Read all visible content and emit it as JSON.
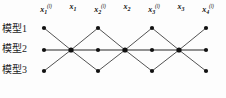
{
  "figure": {
    "background_color": "#fdfdfd",
    "node_color": "#111111",
    "edge_color": "#4a4a4a",
    "middle_edge_color": "#6b6b6b"
  },
  "row_labels": [
    {
      "text": "模型1"
    },
    {
      "text": "模型2"
    },
    {
      "text": "模型3"
    }
  ],
  "column_labels": [
    {
      "base": "x",
      "sub": "1",
      "sup": "(l)",
      "hat": "",
      "x": 46
    },
    {
      "base": "x",
      "sub": "1",
      "sup": "",
      "hat": "ˆ",
      "x": 73
    },
    {
      "base": "x",
      "sub": "2",
      "sup": "(l)",
      "hat": "",
      "x": 100
    },
    {
      "base": "x",
      "sub": "2",
      "sup": "",
      "hat": "ˆ",
      "x": 127
    },
    {
      "base": "x",
      "sub": "3",
      "sup": "(l)",
      "hat": "",
      "x": 154
    },
    {
      "base": "x",
      "sub": "3",
      "sup": "",
      "hat": "ˆ",
      "x": 181
    },
    {
      "base": "x",
      "sub": "4",
      "sup": "(l)",
      "hat": "",
      "x": 208
    }
  ],
  "graph": {
    "columns_x": [
      44,
      71,
      98,
      125,
      152,
      179,
      206
    ],
    "rows_y": {
      "top": 28,
      "middle": 50,
      "bottom": 71
    },
    "nodes": [
      {
        "name": "top-1",
        "col": 0,
        "row": "top"
      },
      {
        "name": "top-2",
        "col": 2,
        "row": "top"
      },
      {
        "name": "top-3",
        "col": 4,
        "row": "top"
      },
      {
        "name": "top-4",
        "col": 6,
        "row": "top"
      },
      {
        "name": "mid-1",
        "col": 0,
        "row": "middle"
      },
      {
        "name": "mid-2",
        "col": 1,
        "row": "middle"
      },
      {
        "name": "mid-3",
        "col": 2,
        "row": "middle"
      },
      {
        "name": "mid-4",
        "col": 3,
        "row": "middle"
      },
      {
        "name": "mid-5",
        "col": 4,
        "row": "middle"
      },
      {
        "name": "mid-6",
        "col": 5,
        "row": "middle"
      },
      {
        "name": "mid-7",
        "col": 6,
        "row": "middle"
      },
      {
        "name": "bottom-1",
        "col": 0,
        "row": "bottom"
      },
      {
        "name": "bottom-2",
        "col": 2,
        "row": "bottom"
      },
      {
        "name": "bottom-3",
        "col": 4,
        "row": "bottom"
      },
      {
        "name": "bottom-4",
        "col": 6,
        "row": "bottom"
      }
    ],
    "edges": [
      {
        "from": "top-1",
        "to": "mid-2"
      },
      {
        "from": "bottom-1",
        "to": "mid-2"
      },
      {
        "from": "mid-2",
        "to": "top-2"
      },
      {
        "from": "mid-2",
        "to": "bottom-2"
      },
      {
        "from": "top-2",
        "to": "mid-4"
      },
      {
        "from": "bottom-2",
        "to": "mid-4"
      },
      {
        "from": "mid-4",
        "to": "top-3"
      },
      {
        "from": "mid-4",
        "to": "bottom-3"
      },
      {
        "from": "top-3",
        "to": "mid-6"
      },
      {
        "from": "bottom-3",
        "to": "mid-6"
      },
      {
        "from": "mid-6",
        "to": "top-4"
      },
      {
        "from": "mid-6",
        "to": "bottom-4"
      },
      {
        "from": "mid-1",
        "to": "mid-7"
      }
    ]
  }
}
